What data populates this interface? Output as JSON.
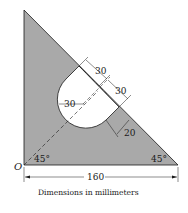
{
  "diagram": {
    "type": "engineering-figure",
    "colors": {
      "plate_fill": "#a9a9a9",
      "outline": "#1a1a1a",
      "background": "#ffffff"
    },
    "labels": {
      "origin": "O",
      "angle_left": "45°",
      "angle_right": "45°",
      "base_dimension": "160",
      "slot_dim_1": "30",
      "slot_dim_2": "30",
      "radius_dim": "30",
      "offset_dim": "20",
      "caption": "Dimensions in millimeters"
    }
  }
}
